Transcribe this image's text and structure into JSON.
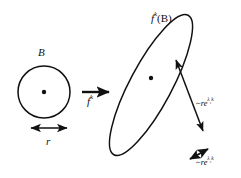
{
  "figure": {
    "domain": "diagram",
    "background_color": "#ffffff",
    "ink_color": "#111111",
    "labels": {
      "ball": "B",
      "radius": "r",
      "map": {
        "base": "f",
        "exponent": "k"
      },
      "image": {
        "base": "f",
        "exponent": "k",
        "argument": "(B)"
      },
      "expanding_rate": {
        "tilde": "~",
        "base": "re",
        "exponent_lambda": "λ",
        "exponent_index": "1",
        "exponent_k": "k"
      },
      "contracting_rate": {
        "tilde": "~",
        "base": "re",
        "exponent_lambda": "λ",
        "exponent_index": "2",
        "exponent_k": "k"
      }
    },
    "shapes": {
      "ball": {
        "name": "circle-B",
        "cx": 44,
        "cy": 92,
        "r": 26
      },
      "ball_center_dot": {
        "cx": 44,
        "cy": 92,
        "r": 2.2
      },
      "image_ellipse": {
        "name": "ellipse-fk-B",
        "cx": 151,
        "cy": 85,
        "rx": 20,
        "ry": 80,
        "rotation_deg": 28
      },
      "image_center_dot": {
        "cx": 151,
        "cy": 78,
        "r": 2.2
      }
    },
    "arrows": {
      "radius_arrow": {
        "name": "radius-double-arrow",
        "x1": 30,
        "y1": 128,
        "x2": 68,
        "y2": 128,
        "heads": "both"
      },
      "map_arrow": {
        "name": "map-arrow",
        "x1": 82,
        "y1": 92,
        "x2": 110,
        "y2": 92,
        "heads": "end"
      },
      "expansion_arrow": {
        "name": "major-axis-double-arrow",
        "x1": 174,
        "y1": 57,
        "x2": 205,
        "y2": 133,
        "heads": "both"
      },
      "contraction_arrow": {
        "name": "minor-axis-double-arrow",
        "x1": 192,
        "y1": 157,
        "x2": 209,
        "y2": 148,
        "heads": "both"
      }
    }
  }
}
